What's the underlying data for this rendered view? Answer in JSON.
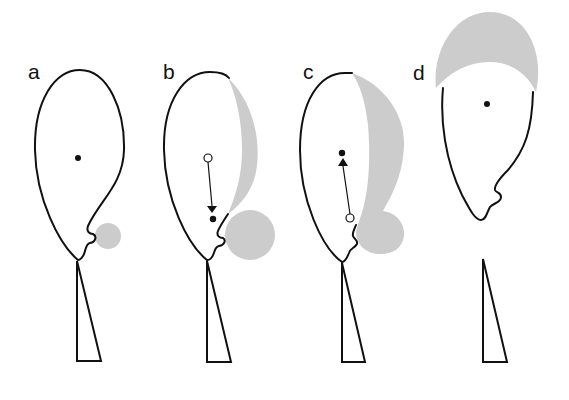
{
  "figure": {
    "colors": {
      "outline": "#111111",
      "shade": "#cccccc",
      "background": "#ffffff"
    },
    "panels": [
      {
        "label": "a",
        "shade_regions": [
          "small circle beside notch"
        ],
        "markers": [
          {
            "type": "filled-dot",
            "role": "center"
          }
        ],
        "arrow": null,
        "stem_attached": true
      },
      {
        "label": "b",
        "shade_regions": [
          "thin crescent along right edge",
          "large circle beside notch"
        ],
        "markers": [
          {
            "type": "open-dot",
            "role": "original center"
          },
          {
            "type": "filled-dot",
            "role": "new center"
          }
        ],
        "arrow": {
          "direction": "down",
          "from": "open-dot",
          "to": "filled-dot"
        },
        "stem_attached": true
      },
      {
        "label": "c",
        "shade_regions": [
          "wide crescent along right edge merged with circle beside notch"
        ],
        "markers": [
          {
            "type": "open-dot",
            "role": "original center"
          },
          {
            "type": "filled-dot",
            "role": "new center"
          }
        ],
        "arrow": {
          "direction": "up",
          "from": "open-dot",
          "to": "filled-dot"
        },
        "stem_attached": true
      },
      {
        "label": "d",
        "shade_regions": [
          "cap on top of body"
        ],
        "markers": [
          {
            "type": "filled-dot",
            "role": "center"
          }
        ],
        "arrow": null,
        "stem_attached": false
      }
    ]
  }
}
